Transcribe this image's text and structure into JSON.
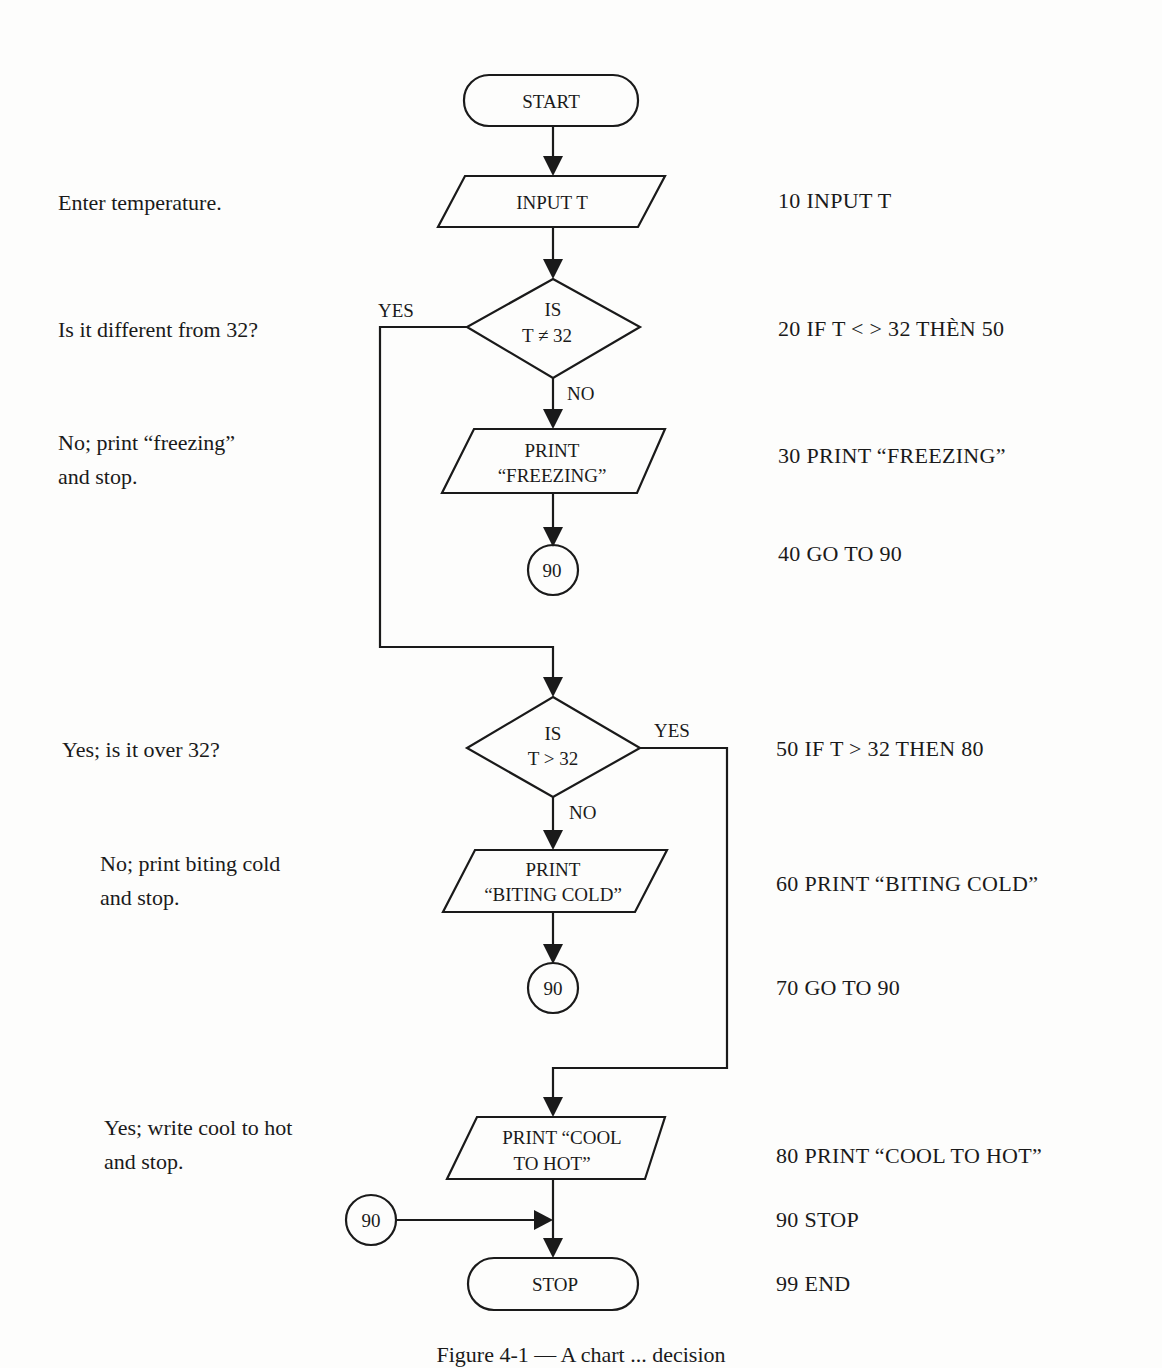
{
  "figure": {
    "caption": "Figure 4-1 — A chart ... decision",
    "nodes": {
      "start": "START",
      "input": "INPUT T",
      "decision1": [
        "IS",
        "T ≠ 32"
      ],
      "print_freezing": [
        "PRINT",
        "“FREEZING”"
      ],
      "connector1": "90",
      "decision2": [
        "IS",
        "T > 32"
      ],
      "print_biting": [
        "PRINT",
        "“BITING COLD”"
      ],
      "connector2": "90",
      "print_cool": [
        "PRINT “COOL",
        "TO HOT”"
      ],
      "connector3": "90",
      "stop": "STOP"
    },
    "branch_labels": {
      "d1_yes": "YES",
      "d1_no": "NO",
      "d2_yes": "YES",
      "d2_no": "NO"
    }
  },
  "notes": [
    "Enter temperature.",
    "Is it different from 32?",
    "No; print “freezing”\nand stop.",
    "Yes; is it over 32?",
    "No; print biting cold\nand stop.",
    "Yes; write cool to hot\nand stop."
  ],
  "program": [
    "10 INPUT T",
    "20 IF T < > 32 THÈN 50",
    "30 PRINT “FREEZING”",
    "40 GO TO 90",
    "50 IF T > 32 THEN 80",
    "60 PRINT “BITING COLD”",
    "70 GO TO 90",
    "80 PRINT “COOL TO HOT”",
    "90 STOP",
    "99 END"
  ]
}
